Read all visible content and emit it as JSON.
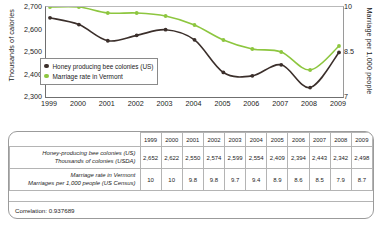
{
  "chart_data": {
    "type": "line",
    "title": "",
    "x": [
      1999,
      2000,
      2001,
      2002,
      2003,
      2004,
      2005,
      2006,
      2007,
      2008,
      2009
    ],
    "xlabel": "",
    "grid": false,
    "legend_position": "inside-left",
    "axes": {
      "left": {
        "label": "Thousands of calories",
        "ticks": [
          "2,300",
          "2,400",
          "2,500",
          "2,600",
          "2,700"
        ],
        "ylim": [
          2300,
          2700
        ]
      },
      "right": {
        "label": "Marriage per 1,000 people",
        "ticks": [
          "7",
          "8.5",
          "10"
        ],
        "ylim": [
          7,
          10
        ]
      }
    },
    "series": [
      {
        "name": "Honey producing bee colonies (US)",
        "axis": "left",
        "color": "#3b2f2b",
        "marker": "circle",
        "values": [
          2652,
          2622,
          2550,
          2574,
          2599,
          2554,
          2409,
          2394,
          2443,
          2342,
          2498
        ]
      },
      {
        "name": "Marriage rate in Vermont",
        "axis": "right",
        "color": "#8dc63f",
        "marker": "circle",
        "values": [
          10,
          10,
          9.8,
          9.8,
          9.7,
          9.4,
          8.9,
          8.6,
          8.5,
          7.9,
          8.7
        ]
      }
    ]
  },
  "legend": {
    "items": [
      {
        "label": "Honey producing bee colonies (US)",
        "color": "#3b2f2b"
      },
      {
        "label": "Marriage rate in Vermont",
        "color": "#8dc63f"
      }
    ]
  },
  "table": {
    "years": [
      "1999",
      "2000",
      "2001",
      "2002",
      "2003",
      "2004",
      "2005",
      "2006",
      "2007",
      "2008",
      "2009"
    ],
    "rows": [
      {
        "label_line1": "Honey-producing bee colonies (US)",
        "label_line2": "Thousands of colonies (USDA)",
        "values": [
          "2,652",
          "2,622",
          "2,550",
          "2,574",
          "2,599",
          "2,554",
          "2,409",
          "2,394",
          "2,443",
          "2,342",
          "2,498"
        ]
      },
      {
        "label_line1": "Marriage rate in Vermont",
        "label_line2": "Marriages per 1,000 people (US Census)",
        "values": [
          "10",
          "10",
          "9.8",
          "9.8",
          "9.7",
          "9.4",
          "8.9",
          "8.6",
          "8.5",
          "7.9",
          "8.7"
        ]
      }
    ],
    "correlation": "Correlation: 0.937689"
  }
}
